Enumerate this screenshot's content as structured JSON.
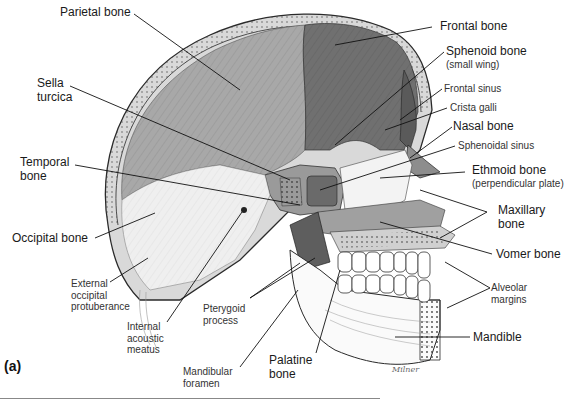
{
  "figure": {
    "panel_label": "(a)",
    "signature": "Milner",
    "colors": {
      "frontal": "#6f6f6f",
      "parietal": "#a9a9a9",
      "occipital": "#e8e8e8",
      "temporal": "#dcdcdc",
      "sphenoid": "#8a8a8a",
      "outline": "#2a2a2a",
      "background": "#ffffff"
    }
  },
  "labels": {
    "parietal": {
      "text": "Parietal bone",
      "weight": "major"
    },
    "sella": {
      "line1": "Sella",
      "line2": "turcica"
    },
    "temporal": {
      "line1": "Temporal",
      "line2": "bone"
    },
    "occipital": {
      "text": "Occipital bone"
    },
    "ext_occ": {
      "line1": "External",
      "line2": "occipital",
      "line3": "protuberance"
    },
    "int_acoustic": {
      "line1": "Internal",
      "line2": "acoustic",
      "line3": "meatus"
    },
    "pterygoid": {
      "line1": "Pterygoid",
      "line2": "process"
    },
    "mand_foramen": {
      "line1": "Mandibular",
      "line2": "foramen"
    },
    "palatine": {
      "line1": "Palatine",
      "line2": "bone"
    },
    "frontal": {
      "text": "Frontal bone"
    },
    "sphenoid": {
      "text": "Sphenoid bone",
      "sub": "(small wing)"
    },
    "frontal_sinus": {
      "text": "Frontal sinus"
    },
    "crista": {
      "text": "Crista galli"
    },
    "nasal": {
      "text": "Nasal bone"
    },
    "sphenoidal_sinus": {
      "text": "Sphenoidal sinus"
    },
    "ethmoid": {
      "text": "Ethmoid bone",
      "sub": "(perpendicular plate)"
    },
    "maxillary": {
      "line1": "Maxillary",
      "line2": "bone"
    },
    "vomer": {
      "text": "Vomer bone"
    },
    "alveolar": {
      "line1": "Alveolar",
      "line2": "margins"
    },
    "mandible": {
      "text": "Mandible"
    }
  }
}
